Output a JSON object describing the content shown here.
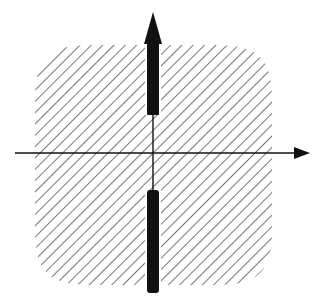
{
  "diagram": {
    "type": "vector-field-axes",
    "colors": {
      "background": "#ffffff",
      "ink": "#111111",
      "hatch": "#555555"
    },
    "hatched_region": {
      "shape": "rounded-square",
      "x": 35,
      "y": 45,
      "width": 237,
      "height": 240,
      "corner_radius": 55,
      "hatch_angle_deg": 45,
      "hatch_spacing": 8
    },
    "horizontal_axis": {
      "y": 153,
      "x_start": 15,
      "x_end": 296,
      "arrow": "right"
    },
    "vertical_axis": {
      "x": 153,
      "y_start": 115,
      "y_end": 190
    },
    "upper_arrow": {
      "x": 153,
      "shaft_top": 42,
      "shaft_bottom": 115,
      "tip_y": 12,
      "shaft_width": 12,
      "head_width": 22
    },
    "lower_bar": {
      "x": 153,
      "top": 190,
      "bottom": 293,
      "width": 12
    }
  }
}
